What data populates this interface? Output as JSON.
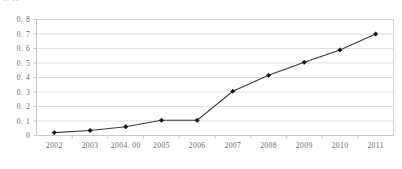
{
  "figure": {
    "clipped_header_text": "0. 00",
    "background_color": "#ffffff",
    "line_color": "#3b3b3b",
    "marker_color": "#111111",
    "grid_color": "#d0d4dc",
    "axis_color": "#b9bdc4",
    "tick_label_color": "#6b6b6b"
  },
  "chart_data": {
    "type": "line",
    "title": "",
    "subtitle": "",
    "xlabel": "",
    "ylabel": "",
    "categories": [
      "2002",
      "2003",
      "2004. 00",
      "2005",
      "2006",
      "2007",
      "2008",
      "2009",
      "2010",
      "2011"
    ],
    "x": [
      2002,
      2003,
      2004,
      2005,
      2006,
      2007,
      2008,
      2009,
      2010,
      2011
    ],
    "values": [
      0.02,
      0.035,
      0.06,
      0.105,
      0.105,
      0.305,
      0.415,
      0.505,
      0.59,
      0.7
    ],
    "ylim": [
      0,
      0.8
    ],
    "yticks": [
      0,
      0.1,
      0.2,
      0.3,
      0.4,
      0.5,
      0.6,
      0.7,
      0.8
    ],
    "ytick_labels": [
      "0",
      "0. 1",
      "0. 2",
      "0. 3",
      "0. 4",
      "0. 5",
      "0. 6",
      "0. 7",
      "0. 8"
    ],
    "grid": true,
    "grid_axis": "y",
    "legend": false,
    "legend_position": "none",
    "marker": "diamond",
    "series": [
      {
        "name": "series1",
        "values": [
          0.02,
          0.035,
          0.06,
          0.105,
          0.105,
          0.305,
          0.415,
          0.505,
          0.59,
          0.7
        ]
      }
    ],
    "annotations": []
  }
}
